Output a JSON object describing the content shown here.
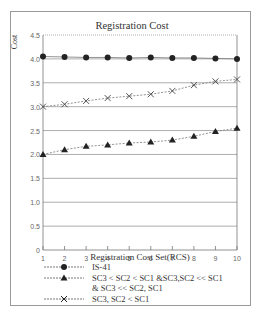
{
  "chart_data": {
    "type": "line",
    "title": "Registration Cost",
    "xlabel": "Registration Cost Set(RCS)",
    "ylabel": "Cost",
    "x": [
      1,
      2,
      3,
      4,
      5,
      6,
      7,
      8,
      9,
      10
    ],
    "xticks": [
      "1",
      "2",
      "3",
      "4",
      "5",
      "6",
      "7",
      "8",
      "9",
      "10"
    ],
    "yticks": [
      "0",
      "0.5",
      "1.0",
      "1.5",
      "2.0",
      "2.5",
      "3.0",
      "3.5",
      "4.0",
      "4.5"
    ],
    "ylim": [
      0,
      4.5
    ],
    "xlim": [
      1,
      10
    ],
    "grid": "horizontal",
    "legend_position": "bottom",
    "series": [
      {
        "name": "IS-41",
        "marker": "circle",
        "values": [
          4.05,
          4.04,
          4.03,
          4.03,
          4.02,
          4.03,
          4.02,
          4.02,
          4.01,
          4.0
        ]
      },
      {
        "name": "SC3 < SC2 < SC1 &SC3,SC2 << SC1 & SC3 << SC2, SC1",
        "marker": "triangle",
        "values": [
          2.0,
          2.1,
          2.17,
          2.2,
          2.24,
          2.26,
          2.3,
          2.38,
          2.48,
          2.55
        ]
      },
      {
        "name": "SC3, SC2 < SC1",
        "marker": "cross",
        "values": [
          3.0,
          3.05,
          3.12,
          3.18,
          3.22,
          3.26,
          3.33,
          3.45,
          3.53,
          3.57
        ]
      }
    ]
  },
  "legend": {
    "items": [
      {
        "label": "IS-41"
      },
      {
        "label": "SC3 < SC2 < SC1 &SC3,SC2 << SC1\n& SC3  << SC2, SC1"
      },
      {
        "label": "SC3, SC2 < SC1"
      }
    ]
  }
}
